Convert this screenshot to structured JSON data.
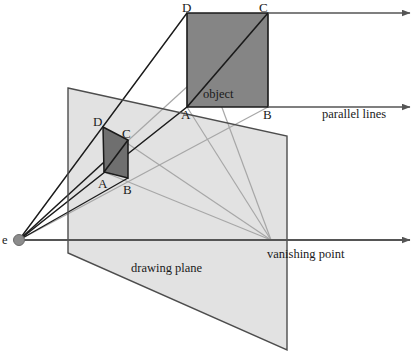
{
  "figure": {
    "colors": {
      "plane_fill": "#e2e2e2",
      "plane_stroke": "#4d4d4d",
      "object_fill": "#858585",
      "object_stroke": "#1a1a1a",
      "projected_fill": "#6f6f6f",
      "ray_dark": "#1a1a1a",
      "ray_light": "#a7a7a7",
      "axis": "#555555",
      "eye_dot": "#8c8c8c",
      "text": "#1a1a1a"
    }
  },
  "labels": {
    "eye": "e",
    "object": "object",
    "drawing_plane": "drawing plane",
    "vanishing_point": "vanishing point",
    "parallel_lines": "parallel lines",
    "object_vertices": {
      "a": "A",
      "b": "B",
      "c": "C",
      "d": "D"
    },
    "projected_vertices": {
      "a": "A",
      "b": "B",
      "c": "C",
      "d": "D"
    }
  },
  "geometry": {
    "eye_point": {
      "x": 19,
      "y": 240,
      "r": 5.5
    },
    "vanishing_point": {
      "x": 271,
      "y": 240
    },
    "object_square": {
      "d": {
        "x": 187,
        "y": 13
      },
      "c": {
        "x": 268,
        "y": 13
      },
      "b": {
        "x": 268,
        "y": 107
      },
      "a": {
        "x": 187,
        "y": 107
      }
    },
    "projected_quad": {
      "d": {
        "x": 103,
        "y": 127
      },
      "c": {
        "x": 128,
        "y": 140
      },
      "b": {
        "x": 128,
        "y": 178
      },
      "a": {
        "x": 104,
        "y": 172
      }
    },
    "drawing_plane": {
      "top_left": {
        "x": 68,
        "y": 88
      },
      "top_right": {
        "x": 287,
        "y": 136
      },
      "bottom_right": {
        "x": 287,
        "y": 350
      },
      "bottom_left": {
        "x": 68,
        "y": 253
      }
    },
    "parallel_line_top": {
      "x1": 268,
      "y1": 13,
      "x2": 410,
      "y2": 13
    },
    "parallel_line_bottom": {
      "x1": 268,
      "y1": 107,
      "x2": 410,
      "y2": 107
    },
    "axis_line": {
      "x1": 19,
      "y1": 240,
      "x2": 410,
      "y2": 240
    }
  },
  "label_positions": {
    "eye": {
      "x": 2,
      "y": 234
    },
    "object": {
      "x": 203,
      "y": 88
    },
    "drawing_plane": {
      "x": 131,
      "y": 262
    },
    "vanishing_point": {
      "x": 267,
      "y": 248
    },
    "parallel_lines": {
      "x": 322,
      "y": 108
    },
    "object_d": {
      "x": 182,
      "y": 1
    },
    "object_c": {
      "x": 259,
      "y": 1
    },
    "object_a": {
      "x": 181,
      "y": 108
    },
    "object_b": {
      "x": 263,
      "y": 108
    },
    "proj_d": {
      "x": 93,
      "y": 115
    },
    "proj_c": {
      "x": 122,
      "y": 127
    },
    "proj_a": {
      "x": 98,
      "y": 177
    },
    "proj_b": {
      "x": 123,
      "y": 183
    }
  }
}
